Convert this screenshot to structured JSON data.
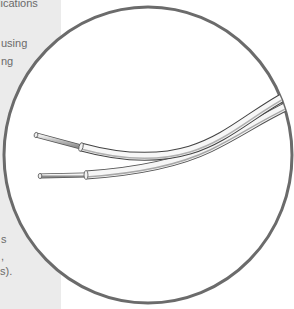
{
  "side_panel": {
    "background": "#ebebeb",
    "text_fragments": [
      {
        "text": "plications",
        "x": -8,
        "y": -3
      },
      {
        "text": "using",
        "x": 1,
        "y": 37
      },
      {
        "text": "ng",
        "x": 1,
        "y": 55
      },
      {
        "text": "s",
        "x": 1,
        "y": 233
      },
      {
        "text": ",",
        "x": 1,
        "y": 253
      },
      {
        "text": "s).",
        "x": 0,
        "y": 265
      }
    ]
  },
  "figure": {
    "shape": "circle-magnifier",
    "stroke_color": "#6b6b6b",
    "fill_color": "#ffffff",
    "content": "two insulated wires with stripped conductor ends",
    "wires": [
      {
        "name": "upper-wire"
      },
      {
        "name": "lower-wire"
      }
    ]
  }
}
